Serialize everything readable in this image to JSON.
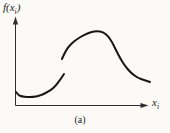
{
  "figure": {
    "background": "#fbfaf7",
    "ink": "#161616",
    "axis_color": "#2e2e2e",
    "y_axis_label": {
      "base": "f(x",
      "sub": "i",
      "post": ")"
    },
    "x_axis_label": {
      "base": "x",
      "sub": "i"
    },
    "caption": "(a)"
  },
  "chart_data": {
    "type": "line",
    "title": "",
    "xlabel": "x_i",
    "ylabel": "f(x_i)",
    "xlim": [
      0,
      1
    ],
    "ylim": [
      0,
      1
    ],
    "grid": false,
    "tick_labels": "none (qualitative sketch, unlabeled axes with arrowheads)",
    "legend": "none",
    "line_color": "#161616",
    "series": [
      {
        "name": "lower-branch",
        "points": [
          [
            0.004,
            0.169
          ],
          [
            0.019,
            0.131
          ],
          [
            0.048,
            0.113
          ],
          [
            0.085,
            0.106
          ],
          [
            0.13,
            0.106
          ],
          [
            0.174,
            0.119
          ],
          [
            0.219,
            0.15
          ],
          [
            0.263,
            0.194
          ],
          [
            0.3,
            0.25
          ],
          [
            0.33,
            0.319
          ],
          [
            0.359,
            0.394
          ]
        ]
      },
      {
        "name": "upper-branch",
        "points": [
          [
            0.344,
            0.581
          ],
          [
            0.374,
            0.694
          ],
          [
            0.411,
            0.769
          ],
          [
            0.456,
            0.831
          ],
          [
            0.507,
            0.881
          ],
          [
            0.559,
            0.919
          ],
          [
            0.604,
            0.931
          ],
          [
            0.648,
            0.919
          ],
          [
            0.685,
            0.869
          ],
          [
            0.715,
            0.794
          ],
          [
            0.744,
            0.694
          ],
          [
            0.774,
            0.594
          ],
          [
            0.811,
            0.494
          ],
          [
            0.856,
            0.406
          ],
          [
            0.907,
            0.344
          ],
          [
            0.952,
            0.319
          ],
          [
            0.996,
            0.294
          ]
        ]
      }
    ]
  }
}
